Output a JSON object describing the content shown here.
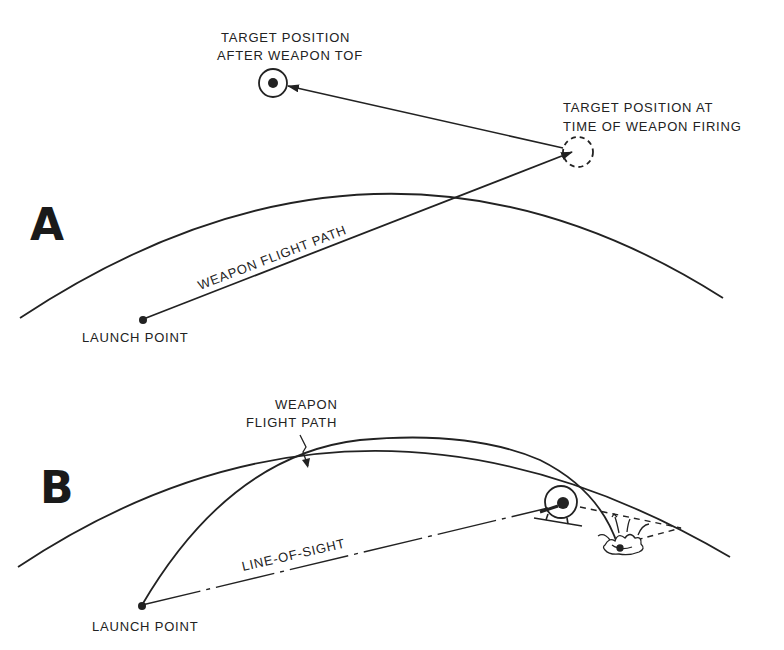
{
  "panel_a": {
    "letter": "A",
    "target_after_tof_label": [
      "TARGET POSITION",
      "AFTER WEAPON TOF"
    ],
    "target_at_firing_label": [
      "TARGET POSITION AT",
      "TIME OF WEAPON FIRING"
    ],
    "flight_path_label": "WEAPON FLIGHT PATH",
    "launch_point_label": "LAUNCH POINT"
  },
  "panel_b": {
    "letter": "B",
    "flight_path_label": [
      "WEAPON",
      "FLIGHT PATH"
    ],
    "line_of_sight_label": "LINE-OF-SIGHT",
    "launch_point_label": "LAUNCH POINT"
  },
  "colors": {
    "ink": "#222222",
    "background": "#ffffff"
  }
}
